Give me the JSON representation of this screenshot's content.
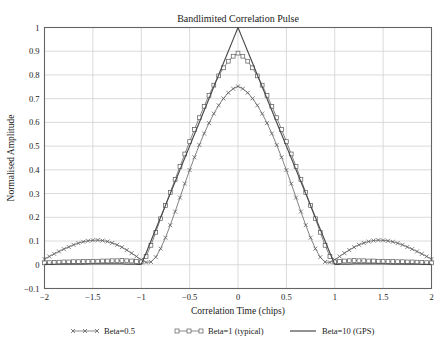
{
  "chart_data": {
    "type": "line",
    "title": "Bandlimited Correlation Pulse",
    "xlabel": "Correlation Time (chips)",
    "ylabel": "Normalised Amplitude",
    "xlim": [
      -2,
      2
    ],
    "ylim": [
      -0.1,
      1
    ],
    "xticks": [
      -2,
      -1.5,
      -1,
      -0.5,
      0,
      0.5,
      1,
      1.5,
      2
    ],
    "xticklabels": [
      "−2",
      "−1.5",
      "−1",
      "−0.5",
      "0",
      "0.5",
      "1",
      "1.5",
      "2"
    ],
    "yticks": [
      -0.1,
      0,
      0.1,
      0.2,
      0.3,
      0.4,
      0.5,
      0.6,
      0.7,
      0.8,
      0.9,
      1
    ],
    "yticklabels": [
      "−0.1",
      "0",
      "0.1",
      "0.2",
      "0.3",
      "0.4",
      "0.5",
      "0.6",
      "0.7",
      "0.8",
      "0.9",
      "1"
    ],
    "grid": true,
    "legend_position": "below-axes",
    "series": [
      {
        "name": "Beta=0.5",
        "marker": "x",
        "color": "#5a5a5a",
        "x": [
          -2,
          -1.95,
          -1.9,
          -1.85,
          -1.8,
          -1.75,
          -1.7,
          -1.65,
          -1.6,
          -1.55,
          -1.5,
          -1.45,
          -1.4,
          -1.35,
          -1.3,
          -1.25,
          -1.2,
          -1.15,
          -1.1,
          -1.05,
          -1,
          -0.95,
          -0.9,
          -0.85,
          -0.8,
          -0.75,
          -0.7,
          -0.65,
          -0.6,
          -0.55,
          -0.5,
          -0.45,
          -0.4,
          -0.35,
          -0.3,
          -0.25,
          -0.2,
          -0.15,
          -0.1,
          -0.05,
          0,
          0.05,
          0.1,
          0.15,
          0.2,
          0.25,
          0.3,
          0.35,
          0.4,
          0.45,
          0.5,
          0.55,
          0.6,
          0.65,
          0.7,
          0.75,
          0.8,
          0.85,
          0.9,
          0.95,
          1,
          1.05,
          1.1,
          1.15,
          1.2,
          1.25,
          1.3,
          1.35,
          1.4,
          1.45,
          1.5,
          1.55,
          1.6,
          1.65,
          1.7,
          1.75,
          1.8,
          1.85,
          1.9,
          1.95,
          2
        ],
        "y": [
          0.024,
          0.035,
          0.046,
          0.056,
          0.066,
          0.075,
          0.084,
          0.091,
          0.097,
          0.101,
          0.103,
          0.104,
          0.102,
          0.098,
          0.092,
          0.084,
          0.074,
          0.062,
          0.049,
          0.035,
          0.021,
          0.01,
          0.012,
          0.032,
          0.068,
          0.114,
          0.167,
          0.224,
          0.283,
          0.342,
          0.399,
          0.453,
          0.505,
          0.553,
          0.597,
          0.637,
          0.672,
          0.701,
          0.725,
          0.742,
          0.752,
          0.742,
          0.725,
          0.701,
          0.672,
          0.637,
          0.597,
          0.553,
          0.505,
          0.453,
          0.399,
          0.342,
          0.283,
          0.224,
          0.167,
          0.114,
          0.068,
          0.032,
          0.012,
          0.01,
          0.021,
          0.035,
          0.049,
          0.062,
          0.074,
          0.084,
          0.092,
          0.098,
          0.102,
          0.104,
          0.103,
          0.101,
          0.097,
          0.091,
          0.084,
          0.075,
          0.066,
          0.056,
          0.046,
          0.035,
          0.024
        ]
      },
      {
        "name": "Beta=1 (typical)",
        "marker": "square",
        "color": "#5a5a5a",
        "x": [
          -2,
          -1.95,
          -1.9,
          -1.85,
          -1.8,
          -1.75,
          -1.7,
          -1.65,
          -1.6,
          -1.55,
          -1.5,
          -1.45,
          -1.4,
          -1.35,
          -1.3,
          -1.25,
          -1.2,
          -1.15,
          -1.1,
          -1.05,
          -1,
          -0.95,
          -0.9,
          -0.85,
          -0.8,
          -0.75,
          -0.7,
          -0.65,
          -0.6,
          -0.55,
          -0.5,
          -0.45,
          -0.4,
          -0.35,
          -0.3,
          -0.25,
          -0.2,
          -0.15,
          -0.1,
          -0.05,
          0,
          0.05,
          0.1,
          0.15,
          0.2,
          0.25,
          0.3,
          0.35,
          0.4,
          0.45,
          0.5,
          0.55,
          0.6,
          0.65,
          0.7,
          0.75,
          0.8,
          0.85,
          0.9,
          0.95,
          1,
          1.05,
          1.1,
          1.15,
          1.2,
          1.25,
          1.3,
          1.35,
          1.4,
          1.45,
          1.5,
          1.55,
          1.6,
          1.65,
          1.7,
          1.75,
          1.8,
          1.85,
          1.9,
          1.95,
          2
        ],
        "y": [
          0.008,
          0.009,
          0.01,
          0.011,
          0.012,
          0.012,
          0.013,
          0.013,
          0.014,
          0.014,
          0.015,
          0.015,
          0.016,
          0.016,
          0.017,
          0.017,
          0.018,
          0.017,
          0.016,
          0.014,
          0.012,
          0.035,
          0.082,
          0.137,
          0.194,
          0.25,
          0.305,
          0.36,
          0.414,
          0.467,
          0.519,
          0.57,
          0.62,
          0.668,
          0.714,
          0.757,
          0.796,
          0.83,
          0.858,
          0.879,
          0.892,
          0.879,
          0.858,
          0.83,
          0.796,
          0.757,
          0.714,
          0.668,
          0.62,
          0.57,
          0.519,
          0.467,
          0.414,
          0.36,
          0.305,
          0.25,
          0.194,
          0.137,
          0.082,
          0.035,
          0.012,
          0.014,
          0.016,
          0.017,
          0.018,
          0.017,
          0.017,
          0.016,
          0.016,
          0.015,
          0.015,
          0.014,
          0.014,
          0.013,
          0.013,
          0.012,
          0.012,
          0.011,
          0.01,
          0.009,
          0.008
        ]
      },
      {
        "name": "Beta=10 (GPS)",
        "marker": "none",
        "color": "#4a4a4a",
        "x": [
          -2,
          -1.9,
          -1.8,
          -1.7,
          -1.6,
          -1.5,
          -1.4,
          -1.3,
          -1.2,
          -1.15,
          -1.1,
          -1.05,
          -1,
          -0.95,
          -0.9,
          -0.85,
          -0.8,
          -0.75,
          -0.7,
          -0.65,
          -0.6,
          -0.55,
          -0.5,
          -0.45,
          -0.4,
          -0.35,
          -0.3,
          -0.25,
          -0.2,
          -0.15,
          -0.1,
          -0.05,
          0,
          0.05,
          0.1,
          0.15,
          0.2,
          0.25,
          0.3,
          0.35,
          0.4,
          0.45,
          0.5,
          0.55,
          0.6,
          0.65,
          0.7,
          0.75,
          0.8,
          0.85,
          0.9,
          0.95,
          1,
          1.05,
          1.1,
          1.15,
          1.2,
          1.3,
          1.4,
          1.5,
          1.6,
          1.7,
          1.8,
          1.9,
          2
        ],
        "y": [
          0.002,
          0.002,
          0.003,
          0.003,
          0.003,
          0.004,
          0.004,
          0.004,
          0.004,
          0.003,
          0.003,
          0.002,
          0.002,
          0.05,
          0.1,
          0.15,
          0.2,
          0.25,
          0.3,
          0.35,
          0.4,
          0.45,
          0.5,
          0.55,
          0.6,
          0.65,
          0.7,
          0.75,
          0.8,
          0.85,
          0.9,
          0.95,
          1,
          0.95,
          0.9,
          0.85,
          0.8,
          0.75,
          0.7,
          0.65,
          0.6,
          0.55,
          0.5,
          0.45,
          0.4,
          0.35,
          0.3,
          0.25,
          0.2,
          0.15,
          0.1,
          0.05,
          0.002,
          0.002,
          0.003,
          0.003,
          0.004,
          0.004,
          0.004,
          0.004,
          0.003,
          0.003,
          0.003,
          0.002,
          0.002
        ]
      }
    ]
  }
}
